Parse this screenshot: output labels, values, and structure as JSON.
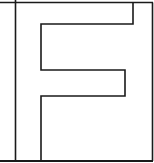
{
  "figure": {
    "letter": "F",
    "stroke_color": "#1a1a1a",
    "background_color": "#ffffff",
    "stroke_width": 1.6
  },
  "shapes": {
    "top_border": {
      "x1": 0,
      "y1": 2.5,
      "x2": 133,
      "y2": 2.5
    },
    "right_border": {
      "x1": 152.5,
      "y1": 2.5,
      "x2": 152.5,
      "y2": 161
    },
    "top_right_notch": {
      "x1": 133,
      "y1": 2.5,
      "x2": 152.5,
      "y2": 2.5
    },
    "bottom_border": {
      "x1": 0,
      "y1": 161,
      "x2": 152.5,
      "y2": 161
    },
    "left_divider": {
      "x1": 15.5,
      "y1": 0,
      "x2": 15.5,
      "y2": 161
    },
    "f_outline_points": "133,2.5 133,24 41,24 41,70 125,70 125,96 41,96 41,161"
  }
}
